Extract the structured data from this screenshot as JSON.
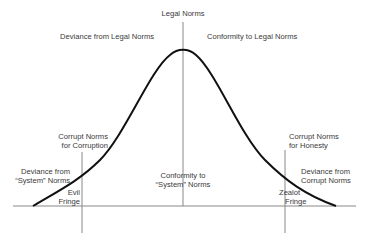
{
  "diagram": {
    "type": "bell-curve",
    "labels": {
      "top": "Legal Norms",
      "upper_left": "Deviance from Legal Norms",
      "upper_right": "Conformity to Legal Norms",
      "left_threshold_line1": "Corrupt Norms",
      "left_threshold_line2": "for Corruption",
      "right_threshold_line1": "Corrupt Norms",
      "right_threshold_line2": "for Honesty",
      "left_deviance_line1": "Deviance from",
      "left_deviance_line2": "“System” Norms",
      "center_line1": "Conformity to",
      "center_line2": "“System” Norms",
      "right_deviance_line1": "Deviance from",
      "right_deviance_line2": "Corrupt Norms",
      "evil_line1": "Evil",
      "evil_line2": "Fringe",
      "zealot_line1": "Zealot",
      "zealot_line2": "Fringe"
    },
    "colors": {
      "curve": "#111111",
      "axis": "#777777"
    }
  }
}
